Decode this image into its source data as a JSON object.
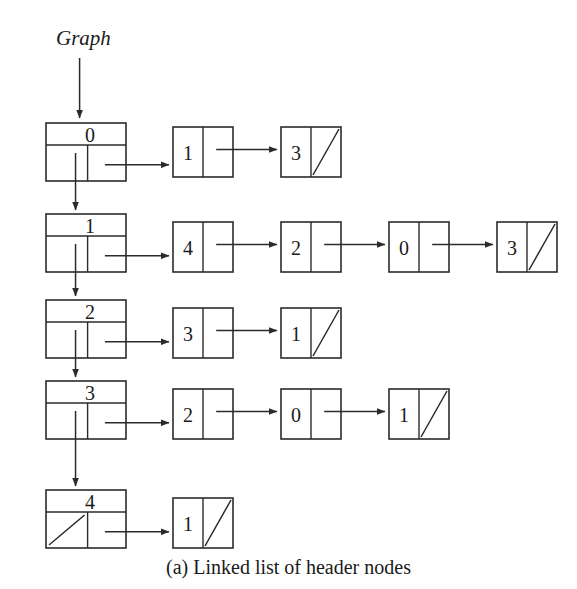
{
  "figure": {
    "caption": "(a) Linked list of header nodes",
    "entry_label": "Graph",
    "caption_x": 0,
    "caption_y": 556,
    "label_x": 56,
    "label_y": 26
  },
  "style": {
    "background": "#ffffff",
    "ink": "#2b2b2b",
    "text": "#1a1a1a"
  },
  "geometry": {
    "header": {
      "x": 46,
      "width": 80,
      "height": 58,
      "top_row_height": 22
    },
    "node": {
      "width": 60,
      "height": 50,
      "first_x": 173,
      "step_x": 108
    },
    "row_tops": [
      123,
      214,
      300,
      381,
      490
    ]
  },
  "chart_data": {
    "type": "diagram",
    "title": "(a) Linked list of header nodes",
    "entry_pointer": "Graph",
    "header_nodes": [
      {
        "index": "0",
        "down_null": false,
        "adjacency": [
          {
            "value": "1",
            "next_null": false
          },
          {
            "value": "3",
            "next_null": true
          }
        ]
      },
      {
        "index": "1",
        "down_null": false,
        "adjacency": [
          {
            "value": "4",
            "next_null": false
          },
          {
            "value": "2",
            "next_null": false
          },
          {
            "value": "0",
            "next_null": false
          },
          {
            "value": "3",
            "next_null": true
          }
        ]
      },
      {
        "index": "2",
        "down_null": false,
        "adjacency": [
          {
            "value": "3",
            "next_null": false
          },
          {
            "value": "1",
            "next_null": true
          }
        ]
      },
      {
        "index": "3",
        "down_null": false,
        "adjacency": [
          {
            "value": "2",
            "next_null": false
          },
          {
            "value": "0",
            "next_null": false
          },
          {
            "value": "1",
            "next_null": true
          }
        ]
      },
      {
        "index": "4",
        "down_null": true,
        "adjacency": [
          {
            "value": "1",
            "next_null": true
          }
        ]
      }
    ]
  }
}
